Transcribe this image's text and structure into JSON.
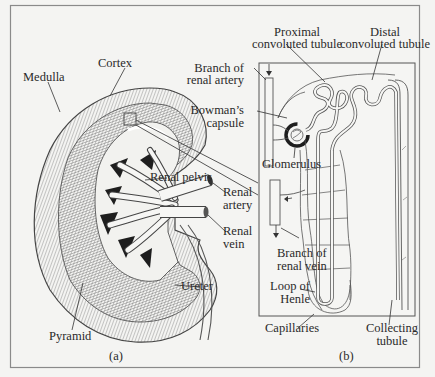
{
  "figure": {
    "panels": [
      {
        "id": "a",
        "caption": "(a)"
      },
      {
        "id": "b",
        "caption": "(b)"
      }
    ],
    "kidney_labels": {
      "cortex": "Cortex",
      "medulla": "Medulla",
      "renal_pelvis": "Renal pelvis",
      "renal_artery_1": "Renal",
      "renal_artery_2": "artery",
      "renal_vein_1": "Renal",
      "renal_vein_2": "vein",
      "ureter": "Ureter",
      "pyramid": "Pyramid"
    },
    "nephron_labels": {
      "proximal_1": "Proximal",
      "proximal_2": "convoluted tubule",
      "distal_1": "Distal",
      "distal_2": "convoluted tubule",
      "branch_artery_1": "Branch of",
      "branch_artery_2": "renal artery",
      "bowmans_1": "Bowman’s",
      "bowmans_2": "capsule",
      "glomerulus": "Glomerulus",
      "branch_vein_1": "Branch of",
      "branch_vein_2": "renal vein",
      "loop_1": "Loop of",
      "loop_2": "Henle",
      "capillaries": "Capillaries",
      "collecting_1": "Collecting",
      "collecting_2": "tubule"
    },
    "colors": {
      "background": "#f4f4f2",
      "ink": "#2a2a2a",
      "frame": "#8a8a8a",
      "hatch": "#6e6e6e",
      "pelvis_dark": "#1e1e1e"
    }
  }
}
